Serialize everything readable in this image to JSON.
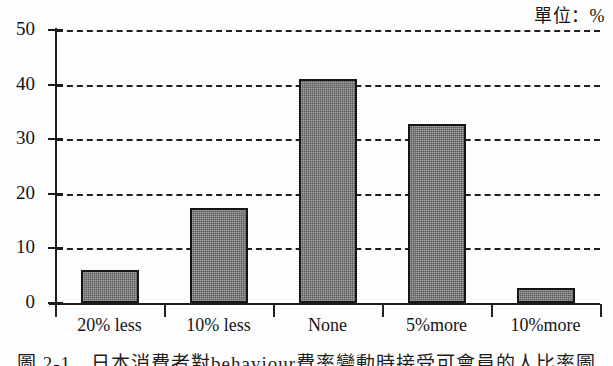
{
  "unit_label": "單位：%",
  "caption": "圖 2-1　日本消費者對behaviour費率變動時接受可會員的人比率圖",
  "axis": {
    "y_ticks": [
      "0",
      "10",
      "20",
      "30",
      "40",
      "50"
    ],
    "y_min": 0,
    "y_max": 50
  },
  "colors": {
    "bar_fill": "#757575",
    "bar_border": "#161616",
    "axis": "#1c1c1c",
    "grid": "#1f1f1f",
    "text": "#151515",
    "background": "#fdfdfd"
  },
  "chart_data": {
    "type": "bar",
    "title": "",
    "subtitle": "",
    "xlabel": "",
    "ylabel": "",
    "unit": "%",
    "categories": [
      "20% less",
      "10% less",
      "None",
      "5%more",
      "10%more"
    ],
    "values": [
      6.0,
      17.4,
      41.0,
      32.8,
      2.7
    ],
    "ylim": [
      0,
      50
    ],
    "yticks": [
      0,
      10,
      20,
      30,
      40,
      50
    ],
    "grid": true,
    "grid_style": "dashed-horizontal",
    "legend": null,
    "legend_position": "none",
    "annotations": [
      "單位：%"
    ]
  }
}
